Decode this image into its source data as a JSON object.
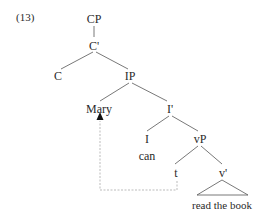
{
  "example_number": "(13)",
  "tree": {
    "nodes": {
      "cp": "CP",
      "c_bar": "C'",
      "c": "C",
      "ip": "IP",
      "mary": "Mary",
      "i_bar": "I'",
      "i": "I",
      "can": "can",
      "vp": "vP",
      "t": "t",
      "v_bar": "v'",
      "read_the_book": "read the book"
    },
    "movement": {
      "from": "t",
      "to": "Mary",
      "style": "dashed-arrow"
    }
  },
  "colors": {
    "lines": "#555555",
    "dashed": "#aaaaaa",
    "text": "#2a2a2a"
  }
}
